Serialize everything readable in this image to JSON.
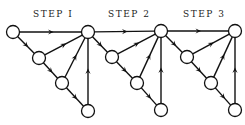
{
  "labels": [
    {
      "text": "STEP I",
      "x": 33,
      "y": 17
    },
    {
      "text": "STEP 2",
      "x": 108,
      "y": 17
    },
    {
      "text": "STEP 3",
      "x": 183,
      "y": 17
    }
  ],
  "nodes": [
    {
      "id": "a",
      "x": 13,
      "y": 32
    },
    {
      "id": "h1",
      "x": 88,
      "y": 32
    },
    {
      "id": "n1a",
      "x": 39,
      "y": 58
    },
    {
      "id": "n1b",
      "x": 62,
      "y": 83
    },
    {
      "id": "n1c",
      "x": 88,
      "y": 111
    },
    {
      "id": "h2",
      "x": 161,
      "y": 31
    },
    {
      "id": "n2a",
      "x": 112,
      "y": 57
    },
    {
      "id": "n2b",
      "x": 137,
      "y": 83
    },
    {
      "id": "n2c",
      "x": 161,
      "y": 110
    },
    {
      "id": "h3",
      "x": 235,
      "y": 31
    },
    {
      "id": "n3a",
      "x": 187,
      "y": 57
    },
    {
      "id": "n3b",
      "x": 211,
      "y": 83
    },
    {
      "id": "n3c",
      "x": 235,
      "y": 110
    }
  ],
  "edges": [
    {
      "from": "a",
      "to": "h1"
    },
    {
      "from": "a",
      "to": "n1a"
    },
    {
      "from": "n1a",
      "to": "h1"
    },
    {
      "from": "n1a",
      "to": "n1b"
    },
    {
      "from": "n1b",
      "to": "h1"
    },
    {
      "from": "n1b",
      "to": "n1c"
    },
    {
      "from": "n1c",
      "to": "h1"
    },
    {
      "from": "h1",
      "to": "h2"
    },
    {
      "from": "h1",
      "to": "n2a"
    },
    {
      "from": "n2a",
      "to": "h2"
    },
    {
      "from": "n2a",
      "to": "n2b"
    },
    {
      "from": "n2b",
      "to": "h2"
    },
    {
      "from": "n2b",
      "to": "n2c"
    },
    {
      "from": "n2c",
      "to": "h2"
    },
    {
      "from": "h2",
      "to": "h3"
    },
    {
      "from": "h2",
      "to": "n3a"
    },
    {
      "from": "n3a",
      "to": "h3"
    },
    {
      "from": "n3a",
      "to": "n3b"
    },
    {
      "from": "n3b",
      "to": "h3"
    },
    {
      "from": "n3b",
      "to": "n3c"
    },
    {
      "from": "n3c",
      "to": "h3"
    }
  ],
  "style": {
    "node_radius": 6.5,
    "stroke": "#111111"
  }
}
